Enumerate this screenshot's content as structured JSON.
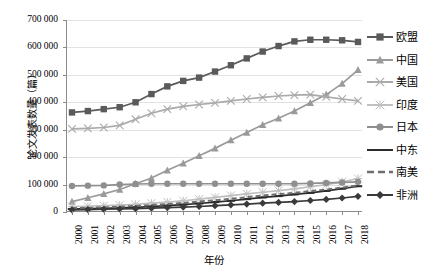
{
  "chart_data": {
    "type": "line",
    "title": "",
    "xlabel": "年份",
    "ylabel": "论文发表数量（篇）",
    "xlim": [
      2000,
      2018
    ],
    "ylim": [
      0,
      700000
    ],
    "ytick_labels": [
      "700 000",
      "600 000",
      "500 000",
      "400 000",
      "300 000",
      "200 000",
      "100 000",
      "0"
    ],
    "ytick_values": [
      700000,
      600000,
      500000,
      400000,
      300000,
      200000,
      100000,
      0
    ],
    "grid": true,
    "legend_position": "right",
    "categories": [
      "2000",
      "2001",
      "2002",
      "2003",
      "2004",
      "2005",
      "2006",
      "2007",
      "2008",
      "2009",
      "2010",
      "2011",
      "2012",
      "2013",
      "2014",
      "2015",
      "2016",
      "2017",
      "2018"
    ],
    "x": [
      2000,
      2001,
      2002,
      2003,
      2004,
      2005,
      2006,
      2007,
      2008,
      2009,
      2010,
      2011,
      2012,
      2013,
      2014,
      2015,
      2016,
      2017,
      2018
    ],
    "series": [
      {
        "name": "欧盟",
        "marker": "square",
        "color": "#5a5a5a",
        "linestyle": "solid",
        "values": [
          363000,
          368000,
          375000,
          382000,
          400000,
          430000,
          458000,
          478000,
          490000,
          512000,
          535000,
          560000,
          585000,
          605000,
          622000,
          628000,
          628000,
          626000,
          620000
        ]
      },
      {
        "name": "中国",
        "marker": "triangle",
        "color": "#9a9a9a",
        "linestyle": "solid",
        "values": [
          38000,
          52000,
          66000,
          82000,
          103000,
          124000,
          152000,
          178000,
          205000,
          232000,
          262000,
          290000,
          318000,
          342000,
          368000,
          398000,
          428000,
          468000,
          518000
        ]
      },
      {
        "name": "美国",
        "marker": "x",
        "color": "#aaaaaa",
        "linestyle": "solid",
        "values": [
          303000,
          305000,
          308000,
          316000,
          338000,
          360000,
          375000,
          385000,
          392000,
          398000,
          405000,
          412000,
          418000,
          423000,
          426000,
          428000,
          420000,
          412000,
          405000
        ]
      },
      {
        "name": "印度",
        "marker": "asterisk",
        "color": "#c0c0c0",
        "linestyle": "solid",
        "values": [
          20000,
          21000,
          23000,
          25000,
          28000,
          32000,
          36000,
          41000,
          47000,
          53000,
          60000,
          66000,
          72000,
          78000,
          84000,
          92000,
          100000,
          110000,
          122000
        ]
      },
      {
        "name": "日本",
        "marker": "circle",
        "color": "#8f8f8f",
        "linestyle": "solid",
        "values": [
          95000,
          96000,
          97000,
          100000,
          102000,
          103000,
          103000,
          103000,
          103000,
          103000,
          103000,
          103000,
          103000,
          103000,
          103000,
          104000,
          106000,
          108000,
          110000
        ]
      },
      {
        "name": "中东",
        "marker": "dash",
        "color": "#2b2b2b",
        "linestyle": "solid",
        "values": [
          11000,
          12000,
          13000,
          15000,
          17000,
          20000,
          23000,
          27000,
          31000,
          36000,
          41000,
          47000,
          53000,
          58000,
          64000,
          70000,
          77000,
          85000,
          94000
        ]
      },
      {
        "name": "南美",
        "marker": "none",
        "color": "#6e6e6e",
        "linestyle": "dashed",
        "values": [
          14000,
          15000,
          17000,
          19000,
          22000,
          25000,
          29000,
          33000,
          38000,
          43000,
          48000,
          54000,
          60000,
          65000,
          70000,
          76000,
          82000,
          89000,
          97000
        ]
      },
      {
        "name": "非洲",
        "marker": "diamond",
        "color": "#3a3a3a",
        "linestyle": "solid",
        "values": [
          8000,
          9000,
          10000,
          11000,
          12000,
          14000,
          16000,
          18000,
          20000,
          23000,
          26000,
          29000,
          32000,
          35000,
          38000,
          42000,
          46000,
          51000,
          57000
        ]
      }
    ]
  }
}
